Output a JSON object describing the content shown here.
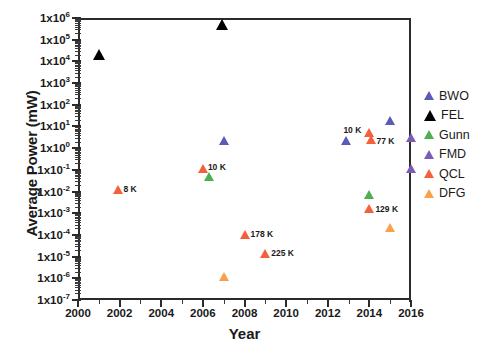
{
  "chart_data": {
    "type": "scatter",
    "title": "",
    "xlabel": "Year",
    "ylabel": "Average Power (mW)",
    "xlim": [
      2000,
      2016
    ],
    "ylim": [
      1e-07,
      1000000.0
    ],
    "yscale": "log",
    "xticks": [
      "2000",
      "2002",
      "2004",
      "2006",
      "2008",
      "2010",
      "2012",
      "2014",
      "2016"
    ],
    "yticks": [
      {
        "label": "1x10",
        "exp": "6",
        "value": 1000000
      },
      {
        "label": "1x10",
        "exp": "5",
        "value": 100000
      },
      {
        "label": "1x10",
        "exp": "4",
        "value": 10000
      },
      {
        "label": "1x10",
        "exp": "3",
        "value": 1000
      },
      {
        "label": "1x10",
        "exp": "2",
        "value": 100
      },
      {
        "label": "1x10",
        "exp": "1",
        "value": 10
      },
      {
        "label": "1x10",
        "exp": "0",
        "value": 1
      },
      {
        "label": "1x10",
        "exp": "-1",
        "value": 0.1
      },
      {
        "label": "1x10",
        "exp": "-2",
        "value": 0.01
      },
      {
        "label": "1x10",
        "exp": "-3",
        "value": 0.001
      },
      {
        "label": "1x10",
        "exp": "-4",
        "value": 0.0001
      },
      {
        "label": "1x10",
        "exp": "-5",
        "value": 1e-05
      },
      {
        "label": "1x10",
        "exp": "-6",
        "value": 1e-06
      },
      {
        "label": "1x10",
        "exp": "-7",
        "value": 1e-07
      }
    ],
    "grid": false,
    "legend_position": "right",
    "series": [
      {
        "name": "BWO",
        "color": "#5b5bb5",
        "points": [
          {
            "x": 2007.0,
            "y": 2.2,
            "label": ""
          },
          {
            "x": 2012.9,
            "y": 2.3,
            "label": ""
          },
          {
            "x": 2015.0,
            "y": 18.0,
            "label": ""
          }
        ]
      },
      {
        "name": "FEL",
        "color": "#000000",
        "points": [
          {
            "x": 2001.0,
            "y": 21000,
            "label": ""
          },
          {
            "x": 2006.9,
            "y": 500000,
            "label": ""
          }
        ]
      },
      {
        "name": "Gunn",
        "color": "#4cb050",
        "points": [
          {
            "x": 2006.3,
            "y": 0.05,
            "label": ""
          },
          {
            "x": 2014.0,
            "y": 0.0075,
            "label": ""
          }
        ]
      },
      {
        "name": "FMD",
        "color": "#7b5bb5",
        "points": [
          {
            "x": 2016.0,
            "y": 3.0,
            "label": ""
          },
          {
            "x": 2016.0,
            "y": 0.11,
            "label": ""
          }
        ]
      },
      {
        "name": "QCL",
        "color": "#f4603c",
        "points": [
          {
            "x": 2001.9,
            "y": 0.013,
            "label": "8 K"
          },
          {
            "x": 2006.0,
            "y": 0.11,
            "label": "10 K"
          },
          {
            "x": 2008.0,
            "y": 0.00011,
            "label": "178 K"
          },
          {
            "x": 2009.0,
            "y": 1.45e-05,
            "label": "225 K"
          },
          {
            "x": 2014.0,
            "y": 5.5,
            "label": "10 K"
          },
          {
            "x": 2014.1,
            "y": 2.6,
            "label": "77 K"
          },
          {
            "x": 2014.0,
            "y": 0.0016,
            "label": "129 K"
          }
        ]
      },
      {
        "name": "DFG",
        "color": "#f5a council",
        "points": []
      }
    ],
    "dfg_points": [
      {
        "x": 2007.0,
        "y": 1.2e-06,
        "label": ""
      },
      {
        "x": 2015.0,
        "y": 0.00022,
        "label": ""
      }
    ],
    "dfg_color": "#f7a койлр",
    "annotations": [
      {
        "text": "8 K",
        "x": 2001.9,
        "y": 0.013
      },
      {
        "text": "10 K",
        "x": 2006.0,
        "y": 0.11
      },
      {
        "text": "178 K",
        "x": 2008.0,
        "y": 0.00011
      },
      {
        "text": "225 K",
        "x": 2009.0,
        "y": 1.45e-05
      },
      {
        "text": "10 K",
        "x": 2014.0,
        "y": 5.5
      },
      {
        "text": "77 K",
        "x": 2014.1,
        "y": 2.6
      },
      {
        "text": "129 K",
        "x": 2014.0,
        "y": 0.0016
      }
    ]
  },
  "axes": {
    "ylabel": "Average Power (mW)",
    "xlabel": "Year"
  },
  "ytick_labels": [
    {
      "mantissa": "1x10",
      "exp": "6"
    },
    {
      "mantissa": "1x10",
      "exp": "5"
    },
    {
      "mantissa": "1x10",
      "exp": "4"
    },
    {
      "mantissa": "1x10",
      "exp": "3"
    },
    {
      "mantissa": "1x10",
      "exp": "2"
    },
    {
      "mantissa": "1x10",
      "exp": "1"
    },
    {
      "mantissa": "1x10",
      "exp": "0"
    },
    {
      "mantissa": "1x10",
      "exp": "-1"
    },
    {
      "mantissa": "1x10",
      "exp": "-2"
    },
    {
      "mantissa": "1x10",
      "exp": "-3"
    },
    {
      "mantissa": "1x10",
      "exp": "-4"
    },
    {
      "mantissa": "1x10",
      "exp": "-5"
    },
    {
      "mantissa": "1x10",
      "exp": "-6"
    },
    {
      "mantissa": "1x10",
      "exp": "-7"
    }
  ],
  "xtick_labels": [
    "2000",
    "2002",
    "2004",
    "2006",
    "2008",
    "2010",
    "2012",
    "2014",
    "2016"
  ],
  "legend": {
    "items": [
      {
        "label": "BWO",
        "color": "#5b5bb5"
      },
      {
        "label": "FEL",
        "color": "#000000"
      },
      {
        "label": "Gunn",
        "color": "#4cb050"
      },
      {
        "label": "FMD",
        "color": "#7b5bb5"
      },
      {
        "label": "QCL",
        "color": "#f4603c"
      },
      {
        "label": "DFG",
        "color": "#f7a24a"
      }
    ]
  }
}
